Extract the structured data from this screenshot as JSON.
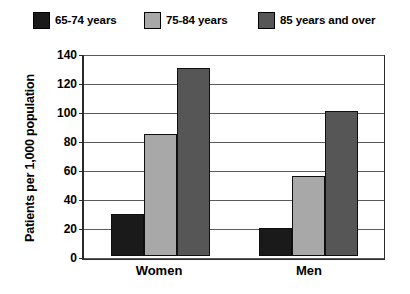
{
  "chart_data": {
    "type": "bar",
    "title": "",
    "xlabel": "",
    "ylabel": "Patients per 1,000 population",
    "categories": [
      "Women",
      "Men"
    ],
    "series": [
      {
        "name": "65-74 years",
        "color": "#1a1a1a",
        "values": [
          29,
          19
        ]
      },
      {
        "name": "75-84 years",
        "color": "#a8a8a8",
        "values": [
          84,
          55
        ]
      },
      {
        "name": "85 years and over",
        "color": "#565656",
        "values": [
          130,
          100
        ]
      }
    ],
    "ylim": [
      0,
      140
    ],
    "yticks": [
      0,
      20,
      40,
      60,
      80,
      100,
      120,
      140
    ],
    "ytick_labels": [
      "0",
      "20",
      "40",
      "60",
      "80",
      "100",
      "120",
      "140"
    ],
    "grid": "horizontal",
    "legend_position": "top",
    "axis_color": "#2b2b2b",
    "grid_color": "#5a5a5a",
    "background": "#ffffff"
  }
}
